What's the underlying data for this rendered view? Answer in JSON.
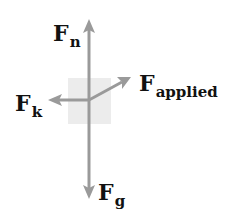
{
  "diagram": {
    "type": "free-body-diagram",
    "colors": {
      "arrow": "#9a9a9a",
      "block": "#ececec",
      "label": "#111111",
      "background": "#ffffff"
    },
    "forces": [
      {
        "id": "normal",
        "symbol": "F",
        "subscript": "n",
        "direction": "up"
      },
      {
        "id": "friction",
        "symbol": "F",
        "subscript": "k",
        "direction": "left"
      },
      {
        "id": "applied",
        "symbol": "F",
        "subscript": "applied",
        "direction": "up-right"
      },
      {
        "id": "gravity",
        "symbol": "F",
        "subscript": "g",
        "direction": "down"
      }
    ]
  }
}
